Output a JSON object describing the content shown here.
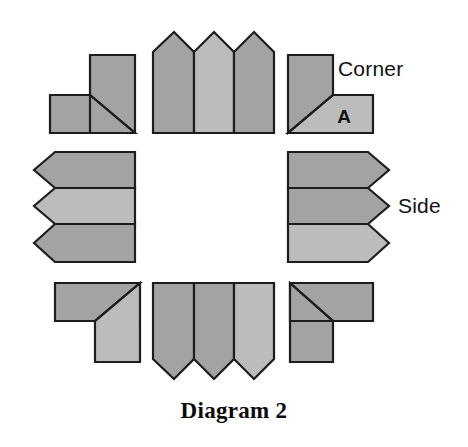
{
  "caption": "Diagram 2",
  "labels": {
    "corner": "Corner",
    "side": "Side",
    "piece_a": "A"
  },
  "colors": {
    "dark_gray": "#a3a3a3",
    "light_gray": "#bcbcbc",
    "outline": "#1d1d1d",
    "background": "#ffffff",
    "text": "#111111"
  },
  "diagram": {
    "type": "puzzle-piece-layout",
    "arrangement": "ring",
    "group_count": 8,
    "corner_piece_count": 4,
    "side_group_count": 4,
    "side_pieces_per_group": 3,
    "groups": [
      {
        "name": "top-left-corner",
        "kind": "corner",
        "piece_count": 2,
        "pieces": [
          {
            "name": "corner-tl-dark",
            "shade": "dark_gray"
          },
          {
            "name": "corner-tl-light",
            "shade": "dark_gray"
          }
        ]
      },
      {
        "name": "top-side-group",
        "kind": "side",
        "piece_count": 3,
        "pieces": [
          {
            "name": "top-side-1",
            "shade": "dark_gray"
          },
          {
            "name": "top-side-2",
            "shade": "light_gray"
          },
          {
            "name": "top-side-3",
            "shade": "dark_gray"
          }
        ]
      },
      {
        "name": "top-right-corner",
        "kind": "corner",
        "piece_count": 2,
        "pieces": [
          {
            "name": "corner-tr-dark",
            "shade": "dark_gray"
          },
          {
            "name": "corner-tr-light",
            "shade": "light_gray",
            "letter": "A"
          }
        ]
      },
      {
        "name": "left-side-group",
        "kind": "side",
        "piece_count": 3,
        "pieces": [
          {
            "name": "left-side-1",
            "shade": "dark_gray"
          },
          {
            "name": "left-side-2",
            "shade": "light_gray"
          },
          {
            "name": "left-side-3",
            "shade": "dark_gray"
          }
        ]
      },
      {
        "name": "right-side-group",
        "kind": "side",
        "piece_count": 3,
        "pieces": [
          {
            "name": "right-side-1",
            "shade": "dark_gray"
          },
          {
            "name": "right-side-2",
            "shade": "dark_gray"
          },
          {
            "name": "right-side-3",
            "shade": "light_gray"
          }
        ]
      },
      {
        "name": "bottom-left-corner",
        "kind": "corner",
        "piece_count": 2,
        "pieces": [
          {
            "name": "corner-bl-dark",
            "shade": "dark_gray"
          },
          {
            "name": "corner-bl-light",
            "shade": "light_gray"
          }
        ]
      },
      {
        "name": "bottom-side-group",
        "kind": "side",
        "piece_count": 3,
        "pieces": [
          {
            "name": "bottom-side-1",
            "shade": "dark_gray"
          },
          {
            "name": "bottom-side-2",
            "shade": "dark_gray"
          },
          {
            "name": "bottom-side-3",
            "shade": "light_gray"
          }
        ]
      },
      {
        "name": "bottom-right-corner",
        "kind": "corner",
        "piece_count": 2,
        "pieces": [
          {
            "name": "corner-br-dark",
            "shade": "dark_gray"
          },
          {
            "name": "corner-br-light",
            "shade": "dark_gray"
          }
        ]
      }
    ]
  }
}
